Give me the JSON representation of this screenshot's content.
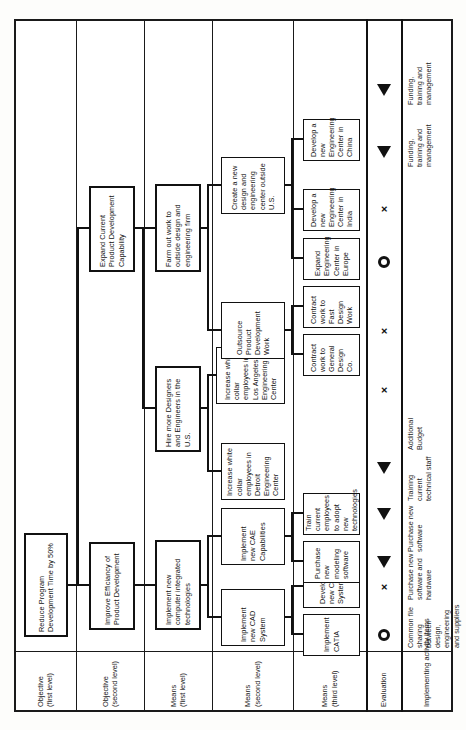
{
  "diagram": {
    "type": "objective-means tree",
    "orientation": "rotated-90-ccw",
    "headers": [
      {
        "id": "objective-1",
        "line1": "Objective",
        "line2": "(first level)"
      },
      {
        "id": "objective-2",
        "line1": "Objective",
        "line2": "(second level)"
      },
      {
        "id": "means-1",
        "line1": "Means",
        "line2": "(first level)"
      },
      {
        "id": "means-2",
        "line1": "Means",
        "line2": "(second level)"
      },
      {
        "id": "means-3",
        "line1": "Means",
        "line2": "(third level)"
      },
      {
        "id": "evaluation",
        "line1": "Evaluation",
        "line2": ""
      },
      {
        "id": "activity",
        "line1": "Implementing activity items",
        "line2": ""
      }
    ],
    "objective_first": [
      {
        "id": "o1",
        "text": "Reduce Program Development Time by 50%"
      }
    ],
    "objective_second": [
      {
        "id": "o2a",
        "text": "Improve Efficiancy of Product Development"
      },
      {
        "id": "o2b",
        "text": "Expand Current Product Development Capability"
      }
    ],
    "means_first": [
      {
        "id": "m1a",
        "text": "Implement new computer integrated technologies"
      },
      {
        "id": "m1b",
        "text": "Hire more Designers and Engineers in the U.S."
      },
      {
        "id": "m1c",
        "text": "Farm out work to outside design and engineering firm"
      }
    ],
    "means_second": [
      {
        "id": "m2a",
        "text": "Implement new CAD System"
      },
      {
        "id": "m2b",
        "text": "Implement new CAE Capabilities"
      },
      {
        "id": "m2c",
        "text": "Increase white collar employees in Detroit Engineering Center"
      },
      {
        "id": "m2d",
        "text": "Increase white collar employees in Los Angeles Engineering Center"
      },
      {
        "id": "m2e",
        "text": "Outsource Product Development Work"
      },
      {
        "id": "m2f",
        "text": "Create a new design and engineering center outside U.S."
      }
    ],
    "means_third": [
      {
        "id": "m3a",
        "text": "Implement CATIA"
      },
      {
        "id": "m3b",
        "text": "Develop new CAD System"
      },
      {
        "id": "m3c",
        "text": "Purchase new modeling software"
      },
      {
        "id": "m3d",
        "text": "Train current employees to adopt new technologies"
      },
      {
        "id": "m3e",
        "text": "Contract work to General Design Co."
      },
      {
        "id": "m3f",
        "text": "Contract work to Fast Design Work"
      },
      {
        "id": "m3g",
        "text": "Expand Engineering Center in Europe"
      },
      {
        "id": "m3h",
        "text": "Develop a new Engineering Center in India"
      },
      {
        "id": "m3i",
        "text": "Develop a new Engineering Center in China"
      }
    ],
    "rows": [
      {
        "index": 0,
        "evaluation": "circle",
        "activity": "Common file sharing between design, engineering and suppliers"
      },
      {
        "index": 1,
        "evaluation": "cross",
        "activity": "Purchase new software and hardware"
      },
      {
        "index": 2,
        "evaluation": "triangle",
        "activity": "Purchase new software"
      },
      {
        "index": 3,
        "evaluation": "triangle",
        "activity": "Training current technical staff"
      },
      {
        "index": 4,
        "evaluation": "triangle",
        "activity": "Additional Budget"
      },
      {
        "index": 5,
        "evaluation": "cross",
        "activity": ""
      },
      {
        "index": 6,
        "evaluation": "cross",
        "activity": ""
      },
      {
        "index": 7,
        "evaluation": "circle",
        "activity": ""
      },
      {
        "index": 8,
        "evaluation": "cross",
        "activity": ""
      },
      {
        "index": 9,
        "evaluation": "triangle",
        "activity": "Funding, training and management"
      },
      {
        "index": 10,
        "evaluation": "triangle",
        "activity": "Funding, training and management"
      }
    ]
  }
}
